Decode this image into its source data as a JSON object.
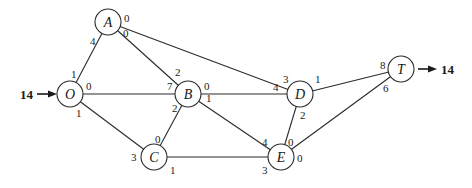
{
  "diagram": {
    "title": "",
    "source_flow": "14",
    "sink_flow": "14",
    "nodes": {
      "O": {
        "label": "O"
      },
      "A": {
        "label": "A"
      },
      "B": {
        "label": "B"
      },
      "C": {
        "label": "C"
      },
      "D": {
        "label": "D"
      },
      "E": {
        "label": "E"
      },
      "T": {
        "label": "T"
      }
    },
    "edges": [
      {
        "from": "O",
        "to": "A",
        "cap_from": "1",
        "cap_to": "4"
      },
      {
        "from": "O",
        "to": "B",
        "cap_from": "0",
        "cap_to": "7"
      },
      {
        "from": "O",
        "to": "C",
        "cap_from": "1",
        "cap_to": "3"
      },
      {
        "from": "A",
        "to": "B",
        "cap_from": "0",
        "cap_to": "2"
      },
      {
        "from": "A",
        "to": "D",
        "cap_from": "0",
        "cap_to": "3"
      },
      {
        "from": "B",
        "to": "C",
        "cap_from": "2",
        "cap_to": "0"
      },
      {
        "from": "B",
        "to": "D",
        "cap_from": "0",
        "cap_to": "4"
      },
      {
        "from": "B",
        "to": "E",
        "cap_from": "1",
        "cap_to": "4"
      },
      {
        "from": "C",
        "to": "E",
        "cap_from": "1",
        "cap_to": "3"
      },
      {
        "from": "D",
        "to": "E",
        "cap_from": "2",
        "cap_to": "0"
      },
      {
        "from": "D",
        "to": "T",
        "cap_from": "1",
        "cap_to": "8"
      },
      {
        "from": "E",
        "to": "T",
        "cap_from": "0",
        "cap_to": "6"
      }
    ]
  }
}
